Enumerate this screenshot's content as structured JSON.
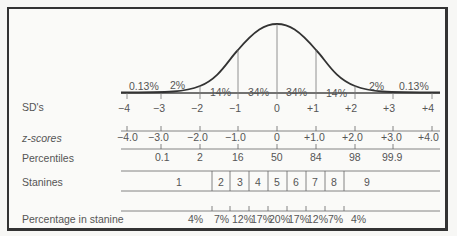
{
  "row_labels": {
    "sd": "SD's",
    "z": "z-scores",
    "percentiles": "Percentiles",
    "stanines": "Stanines",
    "pct_stanine": "Percentage in stanine"
  },
  "curve_area_labels": [
    "0.13%",
    "2%",
    "14%",
    "34%",
    "34%",
    "14%",
    "2%",
    "0.13%"
  ],
  "sd_ticks": [
    "−4",
    "−3",
    "−2",
    "−1",
    "0",
    "+1",
    "+2",
    "+3",
    "+4"
  ],
  "z_scores": [
    "−4.0",
    "−3.0",
    "−2.0",
    "−1.0",
    "0",
    "+1.0",
    "+2.0",
    "+3.0",
    "+4.0"
  ],
  "percentiles": [
    "0.1",
    "2",
    "16",
    "50",
    "84",
    "98",
    "99.9"
  ],
  "stanines": [
    "1",
    "2",
    "3",
    "4",
    "5",
    "6",
    "7",
    "8",
    "9"
  ],
  "percentage_in_stanine": [
    "4%",
    "7%",
    "12%",
    "17%",
    "20%",
    "17%",
    "12%",
    "7%",
    "4%"
  ]
}
